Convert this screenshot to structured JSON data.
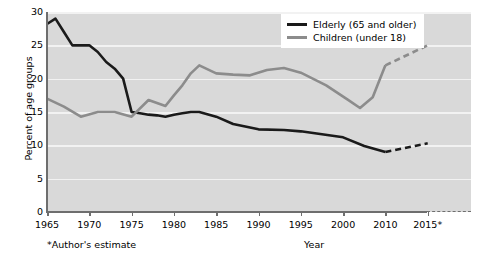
{
  "chart_data": {
    "type": "line",
    "title": "",
    "xlabel": "Year",
    "ylabel": "Percent of age groups",
    "ylim": [
      0,
      30
    ],
    "yticks": [
      0,
      5,
      10,
      15,
      20,
      25,
      30
    ],
    "grid": true,
    "legend_position": "top-right",
    "footnote": "*Author's estimate",
    "xtick_labels": [
      "1965",
      "1970",
      "1975",
      "1980",
      "1985",
      "1990",
      "1995",
      "2000",
      "2010",
      "2015*"
    ],
    "projection_note": "Segments after 2010 are dashed (projected)",
    "series": [
      {
        "name": "Elderly (65 and older)",
        "color": "#1a1a1a",
        "x": [
          1965,
          1966,
          1967,
          1968,
          1969,
          1970,
          1971,
          1972,
          1973,
          1974,
          1975,
          1976,
          1977,
          1978,
          1979,
          1980,
          1981,
          1982,
          1983,
          1985,
          1987,
          1990,
          1993,
          1995,
          2000,
          2005,
          2010,
          2015
        ],
        "values": [
          28.2,
          29.0,
          27.0,
          25.0,
          25.0,
          25.0,
          24.0,
          22.5,
          21.5,
          20.0,
          15.0,
          14.8,
          14.6,
          14.5,
          14.3,
          14.6,
          14.8,
          15.0,
          15.0,
          14.3,
          13.2,
          12.4,
          12.3,
          12.1,
          11.2,
          9.9,
          9.0,
          10.3
        ],
        "dashed_from": 2010
      },
      {
        "name": "Children (under 18)",
        "color": "#8c8c8c",
        "x": [
          1965,
          1967,
          1969,
          1971,
          1973,
          1975,
          1977,
          1979,
          1980,
          1981,
          1982,
          1983,
          1985,
          1987,
          1989,
          1991,
          1993,
          1995,
          1998,
          2001,
          2004,
          2007,
          2010,
          2015
        ],
        "values": [
          17.0,
          15.8,
          14.3,
          15.0,
          15.0,
          14.3,
          16.8,
          15.9,
          17.5,
          19.0,
          20.8,
          22.0,
          20.8,
          20.6,
          20.5,
          21.3,
          21.6,
          20.9,
          19.0,
          16.9,
          15.6,
          17.2,
          22.0,
          25.0
        ],
        "dashed_from": 2010
      }
    ],
    "legend": [
      {
        "label": "Elderly (65 and older)",
        "color": "#1a1a1a"
      },
      {
        "label": "Children (under 18)",
        "color": "#8c8c8c"
      }
    ]
  },
  "colors": {
    "plot_background": "#d9d9d9",
    "gridline": "#f2f2f2",
    "axis": "#6e6e6e",
    "elderly": "#1a1a1a",
    "children": "#8c8c8c"
  }
}
